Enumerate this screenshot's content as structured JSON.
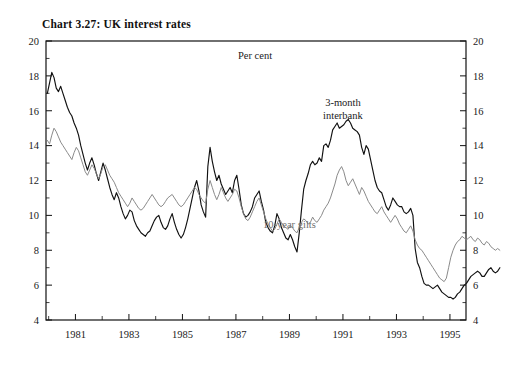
{
  "chart_data": {
    "type": "line",
    "title": "Chart 3.27: UK interest rates",
    "unit_label": "Per cent",
    "xlabel": "",
    "ylabel": "",
    "ylim": [
      4,
      20
    ],
    "ytick_step": 2,
    "yminor_step": 1,
    "xlim": [
      1979.9,
      1995.6
    ],
    "grid": false,
    "legend_position": "inline-annotations",
    "yticks": [
      4,
      6,
      8,
      10,
      12,
      14,
      16,
      18,
      20
    ],
    "yticks_right": [
      4,
      6,
      8,
      10,
      12,
      14,
      16,
      18,
      20
    ],
    "xticks_labeled": [
      1981,
      1983,
      1985,
      1987,
      1989,
      1991,
      1993,
      1995
    ],
    "xticks_minor": [
      1980,
      1982,
      1984,
      1986,
      1988,
      1990,
      1992,
      1994
    ],
    "annotations": [
      {
        "name": "3-month interbank",
        "line1": "3-month",
        "line2": "interbank",
        "x": 1991.0,
        "y": 16.3,
        "color": "#1a1a1a"
      },
      {
        "name": "10-year gilts",
        "line1": "10-year gilts",
        "x": 1989.0,
        "y": 9.3,
        "color": "#6e6e6e"
      }
    ],
    "series": [
      {
        "name": "3-month interbank",
        "color": "#111111",
        "x_start": 1979.95,
        "x_step": 0.08333,
        "values": [
          17.0,
          17.6,
          18.2,
          17.9,
          17.3,
          17.1,
          17.4,
          17.0,
          16.6,
          16.2,
          15.9,
          15.7,
          15.3,
          15.0,
          14.6,
          14.0,
          13.5,
          13.0,
          12.6,
          13.0,
          13.3,
          12.9,
          12.4,
          12.0,
          12.5,
          13.0,
          12.6,
          12.1,
          11.6,
          11.2,
          10.9,
          11.3,
          11.0,
          10.5,
          10.1,
          9.8,
          10.0,
          10.3,
          10.2,
          9.7,
          9.4,
          9.2,
          9.0,
          8.9,
          8.8,
          9.0,
          9.1,
          9.4,
          9.7,
          9.9,
          10.0,
          9.6,
          9.3,
          9.2,
          9.4,
          9.8,
          10.1,
          9.6,
          9.2,
          8.9,
          8.7,
          8.9,
          9.3,
          9.8,
          10.4,
          11.0,
          11.6,
          12.0,
          11.4,
          10.6,
          10.2,
          9.9,
          12.8,
          13.9,
          13.1,
          12.5,
          12.0,
          12.3,
          11.8,
          11.5,
          11.2,
          11.4,
          11.6,
          11.3,
          12.0,
          12.3,
          11.5,
          10.6,
          10.1,
          9.9,
          10.0,
          10.2,
          10.5,
          11.0,
          11.2,
          11.4,
          10.8,
          10.3,
          9.6,
          9.3,
          9.1,
          9.0,
          9.4,
          10.1,
          9.8,
          9.3,
          9.0,
          8.7,
          8.6,
          8.9,
          8.6,
          8.2,
          7.9,
          9.0,
          10.3,
          11.5,
          12.0,
          12.4,
          12.9,
          13.1,
          12.9,
          13.0,
          13.3,
          13.1,
          14.0,
          14.1,
          13.9,
          14.3,
          14.9,
          15.1,
          15.3,
          15.0,
          15.1,
          15.2,
          15.4,
          15.5,
          15.3,
          15.0,
          14.9,
          14.8,
          14.6,
          13.9,
          13.5,
          14.0,
          13.8,
          13.2,
          12.6,
          12.0,
          11.6,
          11.4,
          11.3,
          10.9,
          10.5,
          10.3,
          10.6,
          11.0,
          10.8,
          10.6,
          10.5,
          10.5,
          10.2,
          10.1,
          10.2,
          10.4,
          10.0,
          8.1,
          7.3,
          7.0,
          6.5,
          6.1,
          6.0,
          6.0,
          5.9,
          5.8,
          5.9,
          6.0,
          5.8,
          5.6,
          5.5,
          5.4,
          5.3,
          5.3,
          5.2,
          5.3,
          5.5,
          5.6,
          5.8,
          6.0,
          6.1,
          6.3,
          6.5,
          6.6,
          6.7,
          6.8,
          6.7,
          6.5,
          6.5,
          6.7,
          6.9,
          7.0,
          6.8,
          6.7,
          6.8,
          7.0
        ]
      },
      {
        "name": "10-year gilts",
        "color": "#8a8a8a",
        "x_start": 1979.95,
        "x_step": 0.08333,
        "values": [
          14.3,
          14.1,
          14.6,
          15.0,
          14.8,
          14.5,
          14.2,
          14.0,
          13.8,
          13.6,
          13.4,
          13.2,
          13.6,
          13.9,
          13.7,
          13.3,
          12.9,
          12.5,
          12.3,
          12.6,
          12.9,
          12.7,
          12.4,
          12.1,
          12.4,
          12.8,
          12.9,
          12.6,
          12.3,
          12.1,
          11.9,
          11.6,
          11.3,
          11.1,
          10.9,
          10.7,
          10.5,
          10.7,
          11.0,
          10.8,
          10.6,
          10.4,
          10.3,
          10.4,
          10.6,
          10.8,
          11.0,
          11.2,
          11.0,
          10.8,
          10.6,
          10.5,
          10.6,
          10.8,
          11.0,
          11.1,
          11.2,
          11.0,
          10.8,
          10.6,
          10.5,
          10.6,
          10.8,
          11.0,
          11.2,
          11.4,
          11.6,
          11.5,
          11.2,
          11.0,
          10.8,
          10.7,
          11.5,
          12.0,
          11.6,
          11.2,
          10.9,
          11.2,
          11.6,
          11.3,
          11.0,
          10.8,
          11.0,
          11.2,
          11.5,
          11.4,
          11.0,
          10.5,
          10.1,
          9.8,
          9.7,
          9.9,
          10.2,
          10.5,
          10.8,
          11.0,
          10.6,
          10.2,
          9.8,
          9.5,
          9.3,
          9.1,
          9.2,
          9.5,
          9.8,
          9.6,
          9.4,
          9.3,
          9.2,
          9.4,
          9.3,
          9.1,
          9.0,
          9.3,
          9.6,
          9.8,
          9.7,
          9.5,
          9.6,
          9.9,
          9.7,
          9.6,
          9.8,
          10.0,
          10.3,
          10.5,
          10.7,
          11.0,
          11.4,
          11.8,
          12.3,
          12.6,
          12.8,
          12.5,
          12.0,
          11.7,
          11.9,
          12.1,
          11.8,
          11.5,
          11.2,
          11.6,
          11.4,
          11.1,
          10.8,
          10.6,
          10.4,
          10.2,
          10.1,
          10.3,
          10.5,
          10.2,
          10.0,
          9.8,
          9.6,
          9.8,
          10.0,
          9.8,
          9.5,
          9.3,
          9.1,
          9.0,
          9.2,
          9.4,
          9.1,
          8.6,
          8.3,
          8.1,
          8.0,
          7.8,
          7.6,
          7.4,
          7.2,
          7.0,
          6.8,
          6.6,
          6.4,
          6.3,
          6.2,
          6.4,
          7.0,
          7.6,
          8.0,
          8.3,
          8.5,
          8.6,
          8.8,
          8.7,
          8.6,
          8.7,
          8.8,
          8.6,
          8.5,
          8.7,
          8.6,
          8.4,
          8.3,
          8.5,
          8.4,
          8.2,
          8.1,
          8.0,
          8.1,
          8.0
        ]
      }
    ]
  }
}
